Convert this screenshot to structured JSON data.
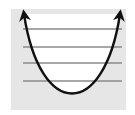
{
  "diagram": {
    "type": "potential-well-energy-levels",
    "background_color": "#e6e6e6",
    "curve_color": "#111111",
    "level_color": "#8a8a8a",
    "energy_levels": [
      {
        "index": 0,
        "y": 81
      },
      {
        "index": 1,
        "y": 63
      },
      {
        "index": 2,
        "y": 47
      },
      {
        "index": 3,
        "y": 29
      }
    ]
  }
}
